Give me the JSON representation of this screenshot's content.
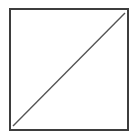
{
  "canvas": {
    "width": 138,
    "height": 139,
    "background": "#ffffff"
  },
  "shapes": {
    "square": {
      "x": 10,
      "y": 9,
      "width": 118,
      "height": 121,
      "fill": "#ffffff",
      "stroke": "#3d3d3d",
      "stroke_width": 2
    },
    "diagonal": {
      "x1": 13,
      "y1": 126,
      "x2": 125,
      "y2": 13,
      "stroke": "#555555",
      "stroke_width": 1.4
    }
  }
}
